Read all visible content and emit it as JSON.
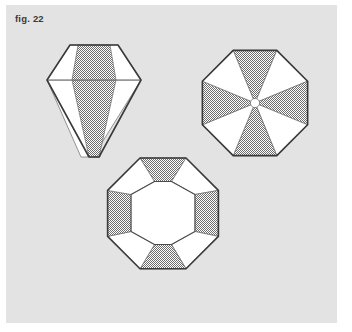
{
  "figure": {
    "caption": "fig. 22",
    "panel": {
      "background_color": "#e3e3e3",
      "page_background_color": "#ffffff"
    },
    "style": {
      "outline_color": "#3a3a3a",
      "facet_line_color": "#6a6a6a",
      "hatch_color": "#8a8a8a",
      "white_facet_color": "#ffffff",
      "hatch_pattern": "50-percent-dither-checker"
    },
    "diagrams": [
      {
        "id": "brilliant-cut-profile",
        "name": "Brilliant cut side profile",
        "position": "top-left",
        "facets": [
          {
            "name": "table-facet",
            "fill": "white"
          },
          {
            "name": "crown-left-facet",
            "fill": "white"
          },
          {
            "name": "crown-right-facet",
            "fill": "white"
          },
          {
            "name": "crown-center-facet",
            "fill": "hatched"
          },
          {
            "name": "pavilion-left-facet",
            "fill": "white"
          },
          {
            "name": "pavilion-right-facet",
            "fill": "white"
          },
          {
            "name": "pavilion-center-facet",
            "fill": "hatched"
          }
        ],
        "girdle_line": true,
        "culet": "flat-point"
      },
      {
        "id": "octagon-star-top-view",
        "name": "Octagon star top view",
        "position": "top-right",
        "wedge_count": 8,
        "wedge_fills": [
          "hatched",
          "white",
          "hatched",
          "white",
          "hatched",
          "white",
          "hatched",
          "white"
        ],
        "center": {
          "name": "culet-circle",
          "fill": "white"
        }
      },
      {
        "id": "octagon-step-cut",
        "name": "Octagon step cut with table",
        "position": "bottom-center",
        "inner_table": {
          "name": "table-octagon",
          "fill": "white"
        },
        "facet_count": 8,
        "facet_fills": [
          "hatched",
          "white",
          "hatched",
          "white",
          "hatched",
          "white",
          "hatched",
          "white"
        ]
      }
    ]
  }
}
